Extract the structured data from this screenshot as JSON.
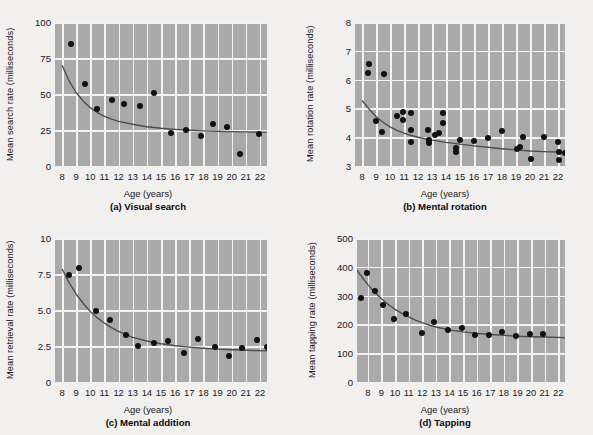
{
  "figure": {
    "background": "#f1f0ef",
    "plot_background": "#a9a9a9",
    "grid_color": "#f2f2f2",
    "marker_color": "#111111",
    "curve_color": "#4d4d4d"
  },
  "shared": {
    "xlabel": "Age (years)",
    "xticks": [
      8,
      9,
      10,
      11,
      12,
      13,
      14,
      15,
      16,
      17,
      18,
      19,
      20,
      21,
      22
    ],
    "xlim": [
      7.5,
      22.5
    ]
  },
  "chart_data": [
    {
      "id": "a",
      "type": "scatter",
      "title": "(a) Visual search",
      "xlabel": "Age (years)",
      "ylabel": "Mean search rate (milliseconds)",
      "xlim": [
        7.5,
        22.5
      ],
      "ylim": [
        0,
        100
      ],
      "yticks": [
        0,
        25,
        50,
        75,
        100
      ],
      "ytick_labels": [
        "0",
        "25",
        "50",
        "75",
        "100"
      ],
      "grid": true,
      "legend": "none",
      "points": [
        {
          "x": 8.6,
          "y": 84.5
        },
        {
          "x": 9.6,
          "y": 56.8
        },
        {
          "x": 10.5,
          "y": 39.5
        },
        {
          "x": 11.5,
          "y": 46.0
        },
        {
          "x": 12.4,
          "y": 43.0
        },
        {
          "x": 13.5,
          "y": 41.5
        },
        {
          "x": 14.5,
          "y": 50.5
        },
        {
          "x": 15.7,
          "y": 23.0
        },
        {
          "x": 16.8,
          "y": 25.0
        },
        {
          "x": 17.8,
          "y": 21.0
        },
        {
          "x": 18.7,
          "y": 29.0
        },
        {
          "x": 19.7,
          "y": 27.0
        },
        {
          "x": 20.6,
          "y": 8.0
        },
        {
          "x": 21.9,
          "y": 22.5
        }
      ],
      "fit_curve": [
        {
          "x": 8.0,
          "y": 70.0
        },
        {
          "x": 8.5,
          "y": 59.0
        },
        {
          "x": 9.0,
          "y": 51.0
        },
        {
          "x": 9.5,
          "y": 45.0
        },
        {
          "x": 10.0,
          "y": 40.5
        },
        {
          "x": 10.5,
          "y": 37.0
        },
        {
          "x": 11.0,
          "y": 34.5
        },
        {
          "x": 11.5,
          "y": 32.5
        },
        {
          "x": 12.0,
          "y": 31.0
        },
        {
          "x": 13.0,
          "y": 29.0
        },
        {
          "x": 14.0,
          "y": 27.3
        },
        {
          "x": 15.0,
          "y": 26.2
        },
        {
          "x": 16.0,
          "y": 25.4
        },
        {
          "x": 17.0,
          "y": 24.8
        },
        {
          "x": 18.0,
          "y": 24.4
        },
        {
          "x": 19.0,
          "y": 24.1
        },
        {
          "x": 20.0,
          "y": 23.9
        },
        {
          "x": 21.0,
          "y": 23.7
        },
        {
          "x": 22.5,
          "y": 23.5
        }
      ]
    },
    {
      "id": "b",
      "type": "scatter",
      "title": "(b) Mental rotation",
      "xlabel": "Age (years)",
      "ylabel": "Mean rotation rate (milliseconds)",
      "xlim": [
        7.5,
        22.5
      ],
      "ylim": [
        3,
        8
      ],
      "yticks": [
        3,
        4,
        5,
        6,
        7,
        8
      ],
      "ytick_labels": [
        "3",
        "4",
        "5",
        "6",
        "7",
        "8"
      ],
      "grid": true,
      "legend": "none",
      "points": [
        {
          "x": 8.5,
          "y": 6.55
        },
        {
          "x": 8.45,
          "y": 6.22
        },
        {
          "x": 9.55,
          "y": 6.18
        },
        {
          "x": 9.0,
          "y": 4.55
        },
        {
          "x": 9.4,
          "y": 4.18
        },
        {
          "x": 10.5,
          "y": 4.72
        },
        {
          "x": 10.9,
          "y": 4.88
        },
        {
          "x": 10.9,
          "y": 4.6
        },
        {
          "x": 11.5,
          "y": 4.85
        },
        {
          "x": 11.5,
          "y": 4.25
        },
        {
          "x": 11.5,
          "y": 3.85
        },
        {
          "x": 12.7,
          "y": 4.25
        },
        {
          "x": 12.8,
          "y": 3.8
        },
        {
          "x": 12.8,
          "y": 3.9
        },
        {
          "x": 13.2,
          "y": 4.08
        },
        {
          "x": 13.5,
          "y": 4.16
        },
        {
          "x": 13.8,
          "y": 4.85
        },
        {
          "x": 13.8,
          "y": 4.5
        },
        {
          "x": 14.7,
          "y": 3.62
        },
        {
          "x": 14.7,
          "y": 3.5
        },
        {
          "x": 15.0,
          "y": 3.9
        },
        {
          "x": 16.0,
          "y": 3.88
        },
        {
          "x": 17.0,
          "y": 3.98
        },
        {
          "x": 18.0,
          "y": 4.2
        },
        {
          "x": 19.1,
          "y": 3.6
        },
        {
          "x": 19.3,
          "y": 3.65
        },
        {
          "x": 19.5,
          "y": 4.0
        },
        {
          "x": 20.1,
          "y": 3.25
        },
        {
          "x": 21.0,
          "y": 4.02
        },
        {
          "x": 22.0,
          "y": 3.85
        },
        {
          "x": 22.1,
          "y": 3.48
        },
        {
          "x": 22.1,
          "y": 3.22
        },
        {
          "x": 22.5,
          "y": 3.45
        }
      ],
      "fit_curve": [
        {
          "x": 8.0,
          "y": 5.28
        },
        {
          "x": 8.5,
          "y": 4.98
        },
        {
          "x": 9.0,
          "y": 4.72
        },
        {
          "x": 9.5,
          "y": 4.52
        },
        {
          "x": 10.0,
          "y": 4.36
        },
        {
          "x": 10.5,
          "y": 4.24
        },
        {
          "x": 11.0,
          "y": 4.14
        },
        {
          "x": 11.5,
          "y": 4.06
        },
        {
          "x": 12.0,
          "y": 4.0
        },
        {
          "x": 13.0,
          "y": 3.9
        },
        {
          "x": 14.0,
          "y": 3.82
        },
        {
          "x": 15.0,
          "y": 3.76
        },
        {
          "x": 16.0,
          "y": 3.7
        },
        {
          "x": 17.0,
          "y": 3.65
        },
        {
          "x": 18.0,
          "y": 3.6
        },
        {
          "x": 19.0,
          "y": 3.56
        },
        {
          "x": 20.0,
          "y": 3.52
        },
        {
          "x": 21.0,
          "y": 3.5
        },
        {
          "x": 22.5,
          "y": 3.48
        }
      ]
    },
    {
      "id": "c",
      "type": "scatter",
      "title": "(c) Mental addition",
      "xlabel": "Age (years)",
      "ylabel": "Mean retrieval rate (milliseconds)",
      "xlim": [
        7.5,
        22.5
      ],
      "ylim": [
        0,
        10
      ],
      "yticks": [
        0,
        2.5,
        5.0,
        7.5,
        10
      ],
      "ytick_labels": [
        "0",
        "2.5",
        "5.0",
        "7.5",
        "10"
      ],
      "grid": true,
      "legend": "none",
      "points": [
        {
          "x": 8.5,
          "y": 7.45
        },
        {
          "x": 9.2,
          "y": 7.95
        },
        {
          "x": 10.4,
          "y": 4.95
        },
        {
          "x": 11.4,
          "y": 4.3
        },
        {
          "x": 12.5,
          "y": 3.25
        },
        {
          "x": 13.4,
          "y": 2.48
        },
        {
          "x": 14.5,
          "y": 2.72
        },
        {
          "x": 15.5,
          "y": 2.88
        },
        {
          "x": 16.6,
          "y": 2.0
        },
        {
          "x": 17.6,
          "y": 3.0
        },
        {
          "x": 18.8,
          "y": 2.45
        },
        {
          "x": 19.8,
          "y": 1.78
        },
        {
          "x": 20.7,
          "y": 2.38
        },
        {
          "x": 21.8,
          "y": 2.9
        },
        {
          "x": 22.5,
          "y": 2.45
        }
      ],
      "fit_curve": [
        {
          "x": 8.0,
          "y": 7.85
        },
        {
          "x": 8.5,
          "y": 6.9
        },
        {
          "x": 9.0,
          "y": 6.1
        },
        {
          "x": 9.5,
          "y": 5.45
        },
        {
          "x": 10.0,
          "y": 4.9
        },
        {
          "x": 10.5,
          "y": 4.45
        },
        {
          "x": 11.0,
          "y": 4.08
        },
        {
          "x": 11.5,
          "y": 3.78
        },
        {
          "x": 12.0,
          "y": 3.52
        },
        {
          "x": 12.5,
          "y": 3.3
        },
        {
          "x": 13.0,
          "y": 3.1
        },
        {
          "x": 14.0,
          "y": 2.85
        },
        {
          "x": 15.0,
          "y": 2.66
        },
        {
          "x": 16.0,
          "y": 2.52
        },
        {
          "x": 17.0,
          "y": 2.42
        },
        {
          "x": 18.0,
          "y": 2.34
        },
        {
          "x": 19.0,
          "y": 2.28
        },
        {
          "x": 20.0,
          "y": 2.24
        },
        {
          "x": 21.0,
          "y": 2.2
        },
        {
          "x": 22.5,
          "y": 2.16
        }
      ]
    },
    {
      "id": "d",
      "type": "scatter",
      "title": "(d) Tapping",
      "xlabel": "Age (years)",
      "ylabel": "Mean tapping rate (milliseconds)",
      "xlim": [
        7.2,
        22.5
      ],
      "ylim": [
        0,
        500
      ],
      "yticks": [
        0,
        100,
        200,
        300,
        400,
        500
      ],
      "ytick_labels": [
        "0",
        "100",
        "200",
        "300",
        "400",
        "500"
      ],
      "grid": true,
      "legend": "none",
      "points": [
        {
          "x": 7.5,
          "y": 290
        },
        {
          "x": 7.9,
          "y": 380
        },
        {
          "x": 8.5,
          "y": 317
        },
        {
          "x": 9.1,
          "y": 268
        },
        {
          "x": 9.9,
          "y": 218
        },
        {
          "x": 10.8,
          "y": 237
        },
        {
          "x": 12.0,
          "y": 171
        },
        {
          "x": 12.9,
          "y": 208
        },
        {
          "x": 13.9,
          "y": 180
        },
        {
          "x": 14.9,
          "y": 187
        },
        {
          "x": 15.9,
          "y": 163
        },
        {
          "x": 16.9,
          "y": 162
        },
        {
          "x": 17.9,
          "y": 172
        },
        {
          "x": 18.9,
          "y": 159
        },
        {
          "x": 19.9,
          "y": 168
        },
        {
          "x": 20.9,
          "y": 165
        }
      ],
      "fit_curve": [
        {
          "x": 7.2,
          "y": 388
        },
        {
          "x": 7.6,
          "y": 362
        },
        {
          "x": 8.0,
          "y": 338
        },
        {
          "x": 8.5,
          "y": 312
        },
        {
          "x": 9.0,
          "y": 289
        },
        {
          "x": 9.5,
          "y": 269
        },
        {
          "x": 10.0,
          "y": 252
        },
        {
          "x": 10.5,
          "y": 238
        },
        {
          "x": 11.0,
          "y": 226
        },
        {
          "x": 11.5,
          "y": 215
        },
        {
          "x": 12.0,
          "y": 206
        },
        {
          "x": 12.5,
          "y": 198
        },
        {
          "x": 13.0,
          "y": 191
        },
        {
          "x": 14.0,
          "y": 181
        },
        {
          "x": 15.0,
          "y": 174
        },
        {
          "x": 16.0,
          "y": 169
        },
        {
          "x": 17.0,
          "y": 165
        },
        {
          "x": 18.0,
          "y": 162
        },
        {
          "x": 19.0,
          "y": 159
        },
        {
          "x": 20.0,
          "y": 157
        },
        {
          "x": 21.0,
          "y": 156
        },
        {
          "x": 22.5,
          "y": 154
        }
      ]
    }
  ]
}
